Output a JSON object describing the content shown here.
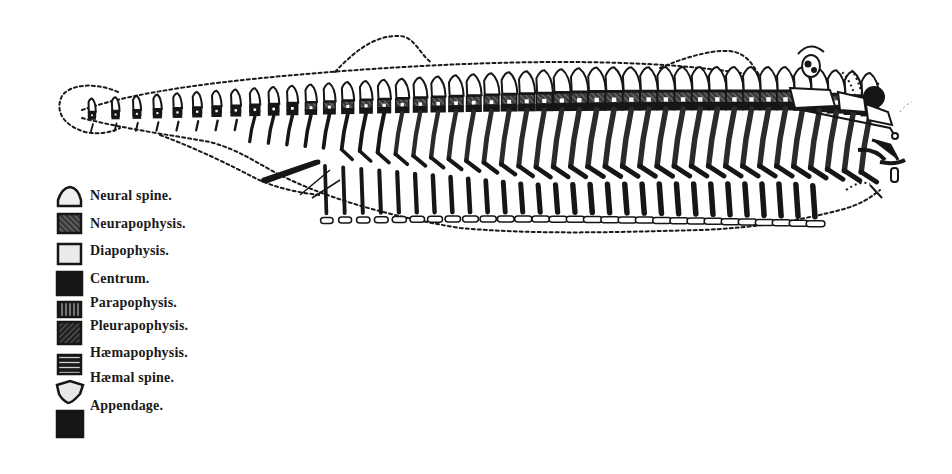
{
  "figure": {
    "colors": {
      "ink": "#161616",
      "paper": "#ffffff",
      "grey_fill": "#5a5a5a",
      "light_fill": "#e6e6e6"
    },
    "vertebra_count": 44
  },
  "legend": {
    "items": [
      {
        "label": "Neural spine.",
        "swatch": "neural-spine-icon"
      },
      {
        "label": "Neurapophysis.",
        "swatch": "neurapophysis-icon"
      },
      {
        "label": "Diapophysis.",
        "swatch": "diapophysis-icon"
      },
      {
        "label": "Centrum.",
        "swatch": "centrum-icon"
      },
      {
        "label": "Parapophysis.",
        "swatch": "parapophysis-icon"
      },
      {
        "label": "Pleurapophysis.",
        "swatch": "pleurapophysis-icon"
      },
      {
        "label": "Hæmapophysis.",
        "swatch": "haemapophysis-icon"
      },
      {
        "label": "Hæmal spine.",
        "swatch": "haemal-spine-icon"
      },
      {
        "label": "Appendage.",
        "swatch": "appendage-icon"
      }
    ]
  }
}
